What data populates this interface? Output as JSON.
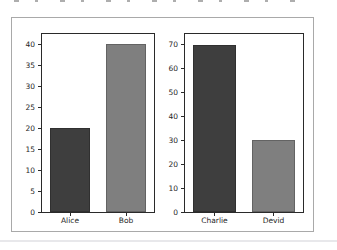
{
  "chart_data": {
    "type": "bar",
    "title": "",
    "layout": {
      "subplot_arrangement": "1x2",
      "grid": false,
      "legend": false
    },
    "subplots": [
      {
        "name": "left-subplot",
        "categories": [
          "Alice",
          "Bob"
        ],
        "values": [
          20,
          40
        ],
        "bar_colors": [
          "#3e3e3e",
          "#7f7f7f"
        ],
        "yticks": [
          0,
          5,
          10,
          15,
          20,
          25,
          30,
          35,
          40
        ],
        "ylim": [
          0,
          42.4
        ],
        "xlabel": "",
        "ylabel": ""
      },
      {
        "name": "right-subplot",
        "categories": [
          "Charlie",
          "Devid"
        ],
        "values": [
          70,
          30
        ],
        "bar_colors": [
          "#3e3e3e",
          "#7f7f7f"
        ],
        "yticks": [
          0,
          10,
          20,
          30,
          40,
          50,
          60,
          70
        ],
        "ylim": [
          0,
          74.5
        ],
        "xlabel": "",
        "ylabel": ""
      }
    ]
  },
  "figure": {
    "background": "#ffffff",
    "border_color": "#a9a9a9",
    "spine_color": "#2a2a2a",
    "tick_label_color": "#262626"
  },
  "page": {
    "background": "#ffffff",
    "separator_color": "#e8e8eb",
    "top_fragment_color": "#6b6b6b"
  }
}
